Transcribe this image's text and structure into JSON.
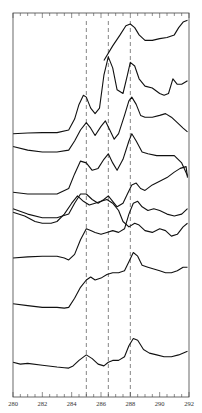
{
  "chart_data": {
    "type": "line",
    "title": "",
    "xlabel": "",
    "ylabel": "",
    "xlim": [
      280,
      292
    ],
    "x_ticks": [
      280,
      282,
      284,
      286,
      288,
      290,
      292
    ],
    "x_tick_labels": [
      "280",
      "282",
      "284",
      "286",
      "288",
      "290",
      "292"
    ],
    "grid": false,
    "legend": null,
    "reference_lines_x": [
      285.0,
      286.5,
      288.0
    ],
    "reference_line_style": "dashed",
    "note": "Eight vertically offset spectra (stacked). Y values are relative plot units (0 = bottom of frame, 100 = top).",
    "series": [
      {
        "name": "trace-1 (top)",
        "x": [
          286.2,
          286.8,
          287.3,
          287.7,
          288.0,
          288.3,
          288.6,
          289.0,
          289.5,
          290.0,
          290.5,
          291.0,
          291.3,
          291.6,
          291.9
        ],
        "y": [
          92,
          96,
          99,
          101.5,
          102,
          101,
          99,
          97.5,
          97.5,
          98,
          98.3,
          99,
          101,
          102.5,
          103
        ]
      },
      {
        "name": "trace-2",
        "x": [
          280.0,
          281.0,
          282.0,
          283.0,
          283.8,
          284.2,
          284.5,
          284.8,
          285.0,
          285.3,
          285.6,
          285.9,
          286.2,
          286.5,
          286.8,
          287.1,
          287.5,
          287.8,
          288.0,
          288.3,
          288.6,
          289.0,
          289.5,
          290.0,
          290.3,
          290.6,
          290.9,
          291.2,
          291.5,
          291.9
        ],
        "y": [
          72,
          72.2,
          72.3,
          72.3,
          73,
          76,
          80,
          82.5,
          82,
          79,
          77.5,
          79,
          88,
          93,
          90,
          84,
          83,
          88,
          91.5,
          90.5,
          87,
          85,
          84.5,
          83,
          82.5,
          83,
          87,
          85.5,
          85.5,
          86.5
        ]
      },
      {
        "name": "trace-3",
        "x": [
          280.0,
          281.0,
          282.0,
          283.0,
          283.8,
          284.2,
          284.6,
          285.0,
          285.3,
          285.6,
          286.0,
          286.3,
          286.6,
          286.9,
          287.2,
          287.6,
          287.9,
          288.1,
          288.4,
          288.7,
          289.0,
          289.5,
          290.0,
          290.4,
          290.8,
          291.2,
          291.6,
          291.9
        ],
        "y": [
          68.5,
          67.5,
          67,
          67,
          67.5,
          70,
          73,
          75,
          73.5,
          71.5,
          74,
          75.5,
          73,
          70.5,
          72,
          77,
          81,
          82,
          80,
          77,
          76.5,
          76.5,
          77,
          77.5,
          76.5,
          75,
          73.5,
          72.5
        ]
      },
      {
        "name": "trace-4",
        "x": [
          280.0,
          281.0,
          282.0,
          283.0,
          283.8,
          284.2,
          284.6,
          285.0,
          285.4,
          285.8,
          286.2,
          286.5,
          286.8,
          287.1,
          287.5,
          287.9,
          288.1,
          288.4,
          288.8,
          289.2,
          289.8,
          290.5,
          291.0,
          291.5,
          291.9
        ],
        "y": [
          56,
          55.5,
          55.5,
          55.5,
          57,
          61,
          64.5,
          64,
          62,
          62.5,
          65,
          66.5,
          64,
          62,
          65,
          70,
          72,
          70,
          67,
          66.5,
          66,
          66,
          66,
          64,
          60.5
        ]
      },
      {
        "name": "trace-5",
        "x": [
          280.0,
          281.0,
          282.0,
          283.0,
          283.8,
          284.2,
          284.6,
          285.0,
          285.4,
          285.8,
          286.2,
          286.5,
          286.8,
          287.1,
          287.5,
          287.8,
          288.1,
          288.4,
          288.7,
          289.0,
          289.5,
          290.0,
          290.5,
          291.0,
          291.4,
          291.8,
          291.9
        ],
        "y": [
          51.5,
          50,
          49,
          49,
          50,
          53,
          55.5,
          55.5,
          54,
          53,
          54,
          55,
          53.5,
          52,
          53,
          55.5,
          58,
          58.5,
          57,
          56.5,
          58,
          59,
          60,
          61.5,
          62.5,
          63,
          60
        ]
      },
      {
        "name": "trace-6",
        "x": [
          280.0,
          280.8,
          281.5,
          282.0,
          282.6,
          283.0,
          283.5,
          284.0,
          284.4,
          284.8,
          285.2,
          285.6,
          286.0,
          286.4,
          286.8,
          287.2,
          287.5,
          287.9,
          288.3,
          288.6,
          289.0,
          289.5,
          290.0,
          290.4,
          290.8,
          291.2,
          291.6,
          291.9
        ],
        "y": [
          50.5,
          49.5,
          48,
          47.5,
          47.5,
          48,
          50,
          53,
          55,
          53.5,
          52.5,
          53,
          53.5,
          54,
          53,
          51,
          48,
          46.5,
          47.5,
          47,
          45.5,
          45,
          46,
          45.5,
          44,
          44.5,
          46.5,
          47.5
        ]
      },
      {
        "name": "trace-7",
        "x": [
          280.0,
          281.0,
          282.0,
          283.0,
          283.5,
          283.8,
          284.2,
          284.6,
          285.0,
          285.3,
          285.6,
          286.0,
          286.4,
          286.8,
          287.2,
          287.6,
          287.9,
          288.2,
          288.5,
          288.8,
          289.2,
          289.6,
          290.0,
          290.5,
          291.0,
          291.5,
          291.9
        ],
        "y": [
          38,
          38.3,
          38.5,
          38.5,
          38,
          37.5,
          39,
          43,
          46,
          45.5,
          45,
          44.5,
          45,
          45.5,
          45,
          46,
          50,
          53,
          53.5,
          52,
          51,
          51.5,
          51,
          50,
          49.5,
          50,
          51.5
        ]
      },
      {
        "name": "trace-8",
        "x": [
          280.0,
          281.0,
          282.0,
          283.0,
          283.5,
          283.8,
          284.2,
          284.6,
          285.0,
          285.3,
          285.6,
          286.0,
          286.4,
          286.8,
          287.2,
          287.6,
          287.9,
          288.2,
          288.5,
          288.8,
          289.2,
          289.6,
          290.0,
          290.4,
          290.8,
          291.2,
          291.6,
          291.9
        ],
        "y": [
          25.5,
          25,
          24.5,
          24.5,
          24.3,
          24.5,
          27,
          30,
          32,
          32.8,
          32,
          32.5,
          33.5,
          34,
          34,
          34.5,
          37,
          39.5,
          38.5,
          36,
          35.5,
          35,
          34.5,
          34,
          34,
          34.5,
          35.5,
          35.5
        ]
      },
      {
        "name": "trace-9 (bottom)",
        "x": [
          280.0,
          280.5,
          281.0,
          282.0,
          283.0,
          283.5,
          283.8,
          284.1,
          284.5,
          285.0,
          285.4,
          285.8,
          286.2,
          286.5,
          286.8,
          287.2,
          287.6,
          287.9,
          288.2,
          288.5,
          288.9,
          289.3,
          289.8,
          290.3,
          290.8,
          291.3,
          291.9
        ],
        "y": [
          9.5,
          9,
          9.2,
          8.7,
          8.2,
          8,
          7.9,
          8.5,
          10,
          11.5,
          10.5,
          9,
          8.5,
          9.5,
          10,
          10,
          11,
          14,
          16,
          15.5,
          13,
          12,
          11.5,
          11,
          11,
          11.5,
          12.5
        ]
      }
    ]
  }
}
